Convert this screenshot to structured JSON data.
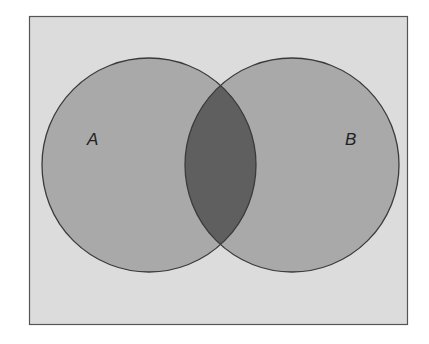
{
  "diagram": {
    "type": "venn",
    "sets": [
      {
        "label": "A",
        "color": "#a9a9a9"
      },
      {
        "label": "B",
        "color": "#a9a9a9"
      }
    ],
    "intersection_color": "#5f5f5f",
    "background_color": "#dcdcdc",
    "stroke_color": "#3a3a3a"
  }
}
